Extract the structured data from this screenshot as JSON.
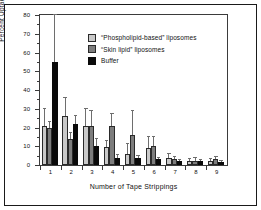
{
  "chart_data": {
    "type": "bar",
    "title": "",
    "xlabel": "Number of Tape Strippings",
    "ylabel": "Percent Uptake",
    "categories": [
      "1",
      "2",
      "3",
      "4",
      "5",
      "6",
      "7",
      "8",
      "9"
    ],
    "ylim": [
      0,
      80
    ],
    "yticks": [
      0,
      10,
      20,
      30,
      40,
      50,
      60,
      70,
      80
    ],
    "ytick_labels": [
      "0",
      "10",
      "20",
      "30",
      "40",
      "50",
      "60",
      "70",
      "80"
    ],
    "y_minor_ticks": [
      5,
      15,
      25,
      35,
      45,
      55,
      65,
      75
    ],
    "grid": false,
    "legend_position": "upper center",
    "error_bars": "upper only",
    "series": [
      {
        "name": "“Phospholipid-based” liposomes",
        "color": "#c9c9c9",
        "values": [
          21,
          26,
          21,
          9.5,
          6,
          9,
          4,
          2,
          2
        ],
        "errors_upper": [
          30,
          36,
          30,
          13,
          11,
          15,
          6,
          3,
          3
        ]
      },
      {
        "name": "“Skin lipid” liposomes",
        "color": "#7d7d7d",
        "values": [
          20,
          14,
          21,
          21,
          16,
          10,
          3,
          2,
          3
        ],
        "errors_upper": [
          23,
          17,
          29,
          27,
          29,
          15,
          4.5,
          3.5,
          4.5
        ]
      },
      {
        "name": "Buffer",
        "color": "#0a0a0a",
        "values": [
          55,
          22,
          10,
          4,
          4,
          3,
          2,
          2,
          1.5
        ],
        "errors_upper": [
          80,
          26,
          14,
          5.5,
          5,
          4,
          2.5,
          2.5,
          2
        ]
      }
    ]
  },
  "legend": {
    "items": [
      {
        "label": "“Phospholipid-based” liposomes",
        "swatch": "s0"
      },
      {
        "label": "“Skin lipid” liposomes",
        "swatch": "s1"
      },
      {
        "label": "Buffer",
        "swatch": "s2"
      }
    ]
  }
}
